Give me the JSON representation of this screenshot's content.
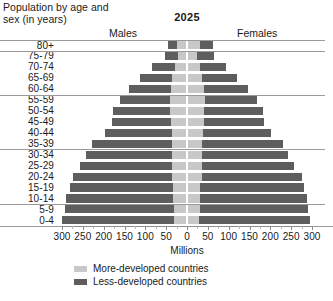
{
  "header": {
    "title_line1": "Population by age and",
    "title_line2": "sex (in years)",
    "year": "2025",
    "males_label": "Males",
    "females_label": "Females"
  },
  "axis": {
    "title": "Millions",
    "tick_labels": [
      "300",
      "250",
      "200",
      "150",
      "100",
      "50",
      "0",
      "50",
      "100",
      "150",
      "200",
      "250",
      "300"
    ],
    "tick_values": [
      -300,
      -250,
      -200,
      -150,
      -100,
      -50,
      0,
      50,
      100,
      150,
      200,
      250,
      300
    ]
  },
  "legend": {
    "items": [
      {
        "label": "More-developed countries",
        "color": "#c8c8c8"
      },
      {
        "label": "Less-developed countries",
        "color": "#5e5e5e"
      }
    ]
  },
  "chart_data": {
    "type": "bar",
    "subtype": "population-pyramid",
    "title": "Population by age and sex (in years)",
    "year": "2025",
    "xlabel": "Millions",
    "ylabel": "Age group (years)",
    "xlim": [
      -300,
      300
    ],
    "xticks": [
      -300,
      -250,
      -200,
      -150,
      -100,
      -50,
      0,
      50,
      100,
      150,
      200,
      250,
      300
    ],
    "xtick_labels": [
      "300",
      "250",
      "200",
      "150",
      "100",
      "50",
      "0",
      "50",
      "100",
      "150",
      "200",
      "250",
      "300"
    ],
    "grid": true,
    "legend_position": "bottom",
    "orientation": "horizontal",
    "stacked": true,
    "categories": [
      "80+",
      "75-79",
      "70-74",
      "65-69",
      "60-64",
      "55-59",
      "50-54",
      "45-49",
      "40-44",
      "35-39",
      "30-34",
      "25-29",
      "20-24",
      "15-19",
      "10-14",
      "5-9",
      "0-4"
    ],
    "sides": [
      "Males",
      "Females"
    ],
    "series": [
      {
        "name": "More-developed countries",
        "color": "#c8c8c8",
        "males": [
          20,
          18,
          25,
          32,
          36,
          38,
          38,
          36,
          34,
          34,
          34,
          33,
          32,
          30,
          30,
          29,
          28
        ],
        "females": [
          28,
          22,
          28,
          34,
          38,
          40,
          39,
          37,
          35,
          34,
          34,
          33,
          32,
          29,
          29,
          28,
          27
        ]
      },
      {
        "name": "Less-developed countries",
        "color": "#5e5e5e",
        "males": [
          22,
          32,
          55,
          78,
          100,
          120,
          136,
          140,
          160,
          192,
          205,
          220,
          238,
          248,
          258,
          262,
          268
        ],
        "females": [
          32,
          40,
          62,
          84,
          106,
          126,
          140,
          144,
          164,
          194,
          206,
          222,
          240,
          248,
          256,
          260,
          266
        ]
      }
    ],
    "totals": {
      "males": [
        42,
        50,
        80,
        110,
        136,
        158,
        174,
        176,
        194,
        226,
        239,
        253,
        270,
        278,
        288,
        291,
        296
      ],
      "females": [
        60,
        62,
        90,
        118,
        144,
        166,
        179,
        181,
        199,
        228,
        240,
        255,
        272,
        277,
        285,
        288,
        293
      ]
    }
  }
}
